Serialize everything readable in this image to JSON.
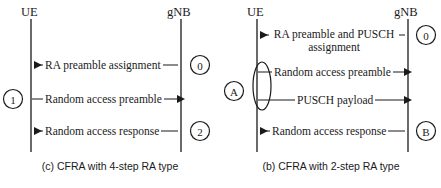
{
  "figure": {
    "width": 441,
    "height": 188,
    "background": "#ffffff",
    "line_color": "#1a1a1a"
  },
  "panels": [
    {
      "id": "cfra-4-step",
      "caption": "(c) CFRA with 4-step RA type",
      "actors": {
        "left": "UE",
        "right": "gNB"
      },
      "messages": [
        {
          "id": "ra-preamble-assignment",
          "text": "RA preamble assignment",
          "direction": "right-to-left",
          "badge": "0",
          "badge_side": "right"
        },
        {
          "id": "random-access-preamble",
          "text": "Random access preamble",
          "direction": "left-to-right",
          "badge": "1",
          "badge_side": "left"
        },
        {
          "id": "random-access-response",
          "text": "Random access response",
          "direction": "right-to-left",
          "badge": "2",
          "badge_side": "right"
        }
      ]
    },
    {
      "id": "cfra-2-step",
      "caption": "(b) CFRA with 2-step RA type",
      "actors": {
        "left": "UE",
        "right": "gNB"
      },
      "group_badge": "A",
      "messages": [
        {
          "id": "ra-preamble-and-pusch-assignment",
          "text": "RA preamble and PUSCH assignment",
          "line1": "RA preamble and PUSCH",
          "line2": "assignment",
          "direction": "right-to-left",
          "badge": "0",
          "badge_side": "right"
        },
        {
          "id": "random-access-preamble",
          "text": "Random access preamble",
          "direction": "left-to-right",
          "badge": "",
          "badge_side": "none"
        },
        {
          "id": "pusch-payload",
          "text": "PUSCH payload",
          "direction": "left-to-right",
          "badge": "",
          "badge_side": "none"
        },
        {
          "id": "random-access-response",
          "text": "Random access response",
          "direction": "right-to-left",
          "badge": "B",
          "badge_side": "right"
        }
      ]
    }
  ]
}
